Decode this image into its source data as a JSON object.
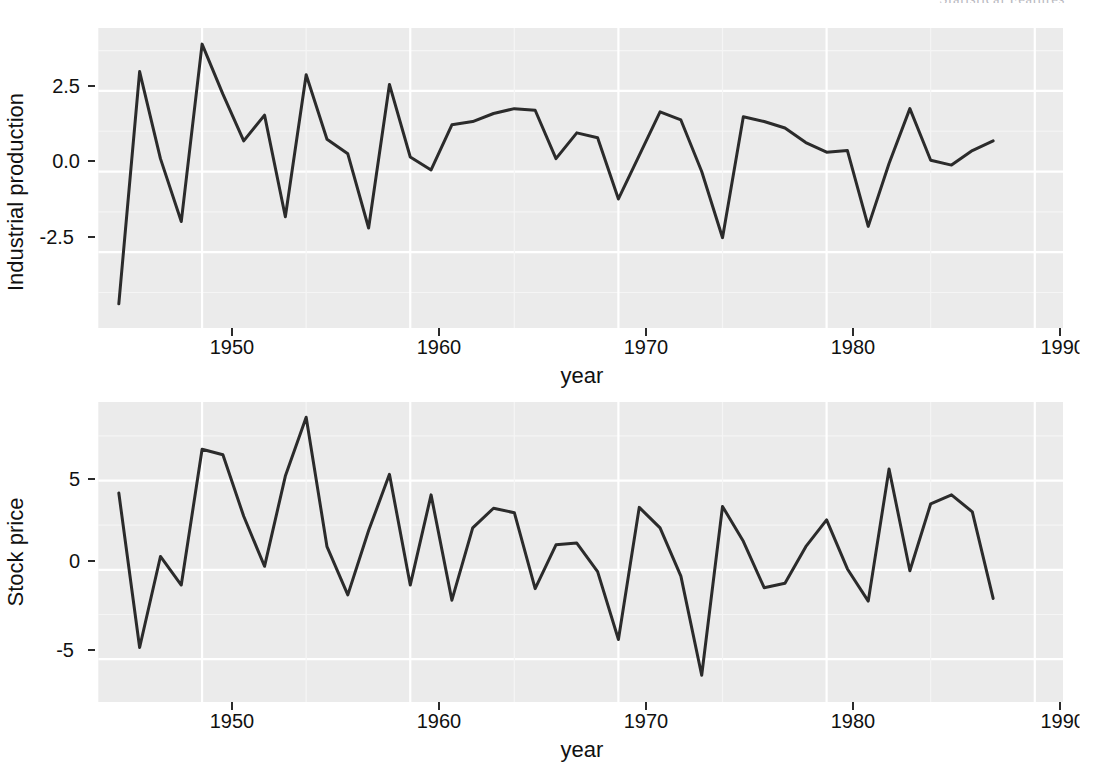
{
  "running_header": "Statistical Features",
  "colors": {
    "panel_background": "#ebebeb",
    "grid_major": "#ffffff",
    "grid_minor": "#f5f5f5",
    "line": "#2b2b2b",
    "text": "#111111",
    "page_background": "#ffffff"
  },
  "panels": [
    {
      "id": "industrial-production",
      "ylabel": "Industrial production",
      "xlabel": "year",
      "yticks": [
        "2.5",
        "0.0",
        "-2.5"
      ],
      "ytick_values": [
        2.5,
        0.0,
        -2.5
      ],
      "xticks": [
        "1950",
        "1960",
        "1970",
        "1980",
        "1990"
      ],
      "xtick_values": [
        1950,
        1960,
        1970,
        1980,
        1990
      ]
    },
    {
      "id": "stock-price",
      "ylabel": "Stock price",
      "xlabel": "year",
      "yticks": [
        "5",
        "0",
        "-5"
      ],
      "ytick_values": [
        5,
        0,
        -5
      ],
      "xticks": [
        "1950",
        "1960",
        "1970",
        "1980",
        "1990"
      ],
      "xtick_values": [
        1950,
        1960,
        1970,
        1980,
        1990
      ]
    }
  ],
  "chart_data": [
    {
      "type": "line",
      "id": "industrial-production",
      "title": "",
      "xlabel": "year",
      "ylabel": "Industrial production",
      "xlim": [
        1945.0,
        1991.5
      ],
      "ylim": [
        -4.85,
        4.45
      ],
      "xticks": [
        1950,
        1960,
        1970,
        1980,
        1990
      ],
      "yticks": [
        -2.5,
        0.0,
        2.5
      ],
      "grid": true,
      "legend": "none",
      "x": [
        1946,
        1947,
        1948,
        1949,
        1950,
        1951,
        1952,
        1953,
        1954,
        1955,
        1956,
        1957,
        1958,
        1959,
        1960,
        1961,
        1962,
        1963,
        1964,
        1965,
        1966,
        1967,
        1968,
        1969,
        1970,
        1971,
        1972,
        1973,
        1974,
        1975,
        1976,
        1977,
        1978,
        1979,
        1980,
        1981,
        1982,
        1983,
        1984,
        1985,
        1986,
        1987,
        1988
      ],
      "values": [
        -4.1,
        3.1,
        0.4,
        -1.55,
        3.95,
        2.4,
        0.95,
        1.75,
        -1.4,
        3.0,
        1.0,
        0.55,
        -1.75,
        2.7,
        0.45,
        0.05,
        1.45,
        1.55,
        1.8,
        1.95,
        1.9,
        0.4,
        1.2,
        1.05,
        -0.85,
        0.5,
        1.85,
        1.6,
        0.0,
        -2.05,
        1.7,
        1.55,
        1.35,
        0.9,
        0.6,
        0.65,
        -1.7,
        0.25,
        1.95,
        0.35,
        0.2,
        0.65,
        0.95
      ]
    },
    {
      "type": "line",
      "id": "stock-price",
      "title": "",
      "xlabel": "year",
      "ylabel": "Stock price",
      "xlim": [
        1945.0,
        1991.5
      ],
      "ylim": [
        -7.4,
        9.4
      ],
      "xticks": [
        1950,
        1960,
        1970,
        1980,
        1990
      ],
      "yticks": [
        -5,
        0,
        5
      ],
      "grid": true,
      "legend": "none",
      "x": [
        1946,
        1947,
        1948,
        1949,
        1950,
        1951,
        1952,
        1953,
        1954,
        1955,
        1956,
        1957,
        1958,
        1959,
        1960,
        1961,
        1962,
        1963,
        1964,
        1965,
        1966,
        1967,
        1968,
        1969,
        1970,
        1971,
        1972,
        1973,
        1974,
        1975,
        1976,
        1977,
        1978,
        1979,
        1980,
        1981,
        1982,
        1983,
        1984,
        1985,
        1986,
        1987,
        1988
      ],
      "values": [
        4.3,
        -4.35,
        0.75,
        -0.85,
        6.75,
        6.45,
        3.0,
        0.2,
        5.25,
        8.55,
        1.3,
        -1.4,
        2.2,
        5.35,
        -0.85,
        4.2,
        -1.7,
        2.35,
        3.45,
        3.2,
        -1.05,
        1.4,
        1.5,
        -0.1,
        -3.9,
        3.5,
        2.35,
        -0.35,
        -5.9,
        3.55,
        1.6,
        -1.0,
        -0.75,
        1.3,
        2.8,
        0.05,
        -1.75,
        5.65,
        -0.05,
        3.7,
        4.2,
        3.25,
        -1.6
      ]
    }
  ]
}
